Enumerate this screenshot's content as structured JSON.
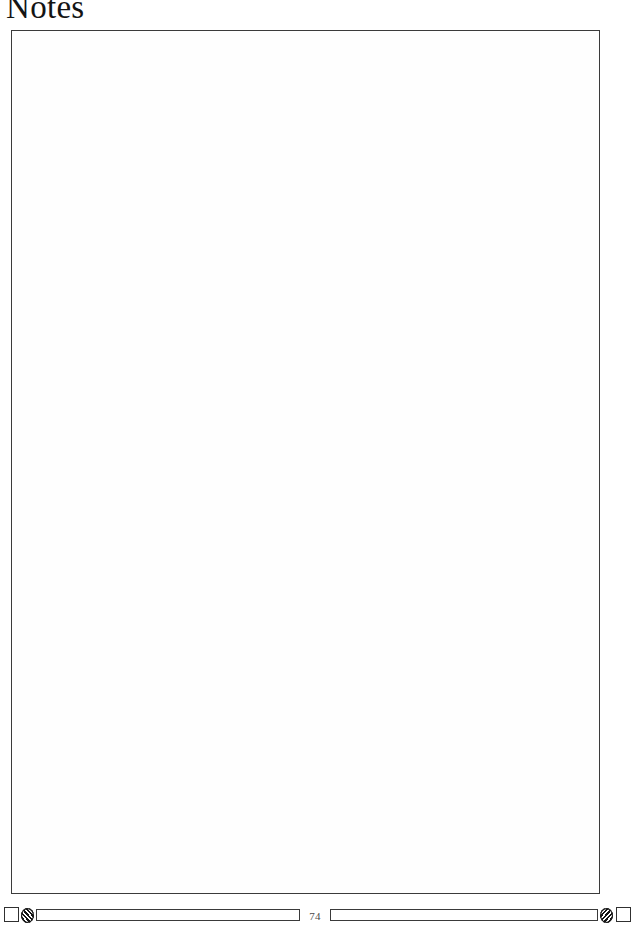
{
  "page": {
    "title": "Notes",
    "page_number": "74",
    "paper_color": "#ffffff",
    "ink_color": "#141414",
    "rule_color": "#3b3b3b"
  },
  "notes_area": {
    "label": "Notes",
    "content": "",
    "placeholder": ""
  },
  "footer": {
    "page_number": "74",
    "ornaments": [
      {
        "name": "square",
        "side": "left"
      },
      {
        "name": "hatched-ellipse",
        "side": "left"
      },
      {
        "name": "bar",
        "side": "left"
      },
      {
        "name": "bar",
        "side": "right"
      },
      {
        "name": "hatched-ellipse",
        "side": "right"
      },
      {
        "name": "square",
        "side": "right"
      }
    ]
  }
}
